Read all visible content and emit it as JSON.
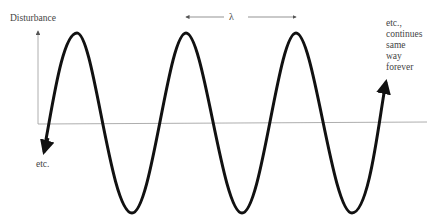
{
  "diagram": {
    "y_axis_label": "Disturbance",
    "wavelength_label": "λ",
    "left_note": "etc.",
    "right_note_lines": [
      "etc.,",
      "continues",
      "same",
      "way",
      "forever"
    ],
    "colors": {
      "wave": "#111111",
      "axis": "#888888",
      "text": "#444444"
    }
  }
}
